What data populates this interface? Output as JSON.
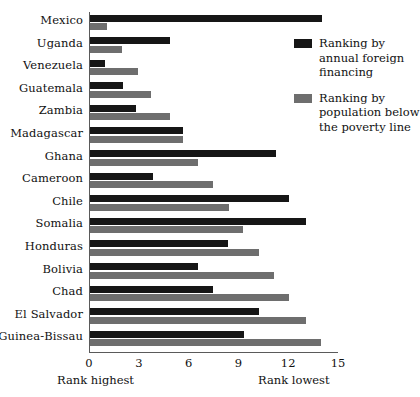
{
  "chart_data": {
    "type": "bar",
    "orientation": "horizontal",
    "title": "",
    "xlabel": "",
    "ylabel": "",
    "xlim": [
      0,
      15
    ],
    "xticks": [
      "0",
      "3",
      "6",
      "9",
      "12",
      "15"
    ],
    "grid": false,
    "legend_position": "right",
    "axis_captions": {
      "low_end": "Rank highest",
      "high_end": "Rank lowest"
    },
    "categories": [
      "Mexico",
      "Uganda",
      "Venezuela",
      "Guatemala",
      "Zambia",
      "Madagascar",
      "Ghana",
      "Cameroon",
      "Chile",
      "Somalia",
      "Honduras",
      "Bolivia",
      "Chad",
      "El Salvador",
      "Guinea-Bissau"
    ],
    "series": [
      {
        "name": "Ranking by annual foreign financing",
        "color": "#161616",
        "values": [
          14.0,
          4.8,
          0.9,
          2.0,
          2.8,
          5.6,
          11.2,
          3.8,
          12.0,
          13.0,
          8.3,
          6.5,
          7.4,
          10.2,
          9.3
        ]
      },
      {
        "name": "Ranking by population below the poverty line",
        "color": "#6e6e6e",
        "values": [
          1.0,
          1.9,
          2.9,
          3.7,
          4.8,
          5.6,
          6.5,
          7.4,
          8.4,
          9.2,
          10.2,
          11.1,
          12.0,
          13.0,
          13.9
        ]
      }
    ]
  },
  "legend": {
    "entries": [
      {
        "label_line1": "Ranking by",
        "label_line2": "annual foreign",
        "label_line3": "financing",
        "color": "#161616"
      },
      {
        "label_line1": "Ranking by",
        "label_line2": "population below",
        "label_line3": "the poverty line",
        "color": "#6e6e6e"
      }
    ]
  }
}
